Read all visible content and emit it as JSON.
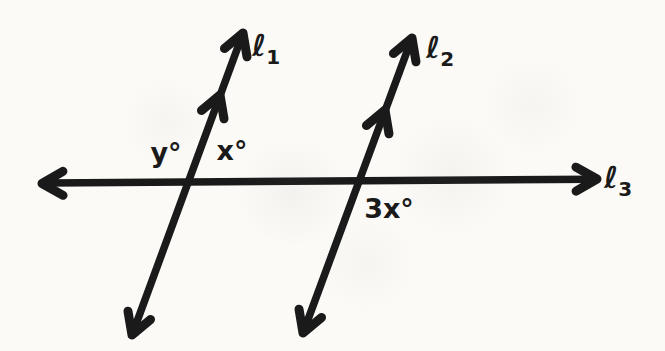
{
  "figure": {
    "colors": {
      "ink": "#1a1a1a",
      "paper": "#fbfaf7"
    },
    "lines": [
      {
        "id": "l1",
        "label_base": "ℓ",
        "label_sub": "1"
      },
      {
        "id": "l2",
        "label_base": "ℓ",
        "label_sub": "2"
      },
      {
        "id": "l3",
        "label_base": "ℓ",
        "label_sub": "3"
      }
    ],
    "angle_labels": [
      {
        "id": "y",
        "text": "y°"
      },
      {
        "id": "x",
        "text": "x°"
      },
      {
        "id": "3x",
        "text": "3x°"
      }
    ]
  }
}
